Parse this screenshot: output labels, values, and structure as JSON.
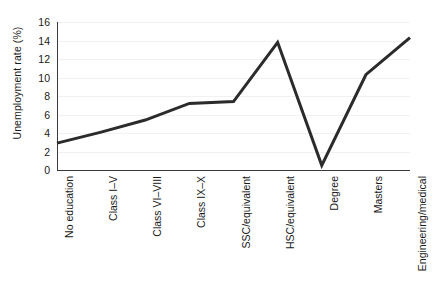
{
  "chart_data": {
    "type": "line",
    "title": "",
    "xlabel": "",
    "ylabel": "Unemployment rate (%)",
    "categories": [
      "No education",
      "Class I–V",
      "Class VI–VIII",
      "Class IX–X",
      "SSC/equivalent",
      "HSC/equivalent",
      "Degree",
      "Masters",
      "Engineering/medical"
    ],
    "values": [
      2.9,
      4.1,
      5.4,
      7.2,
      7.4,
      13.8,
      0.5,
      10.3,
      14.3
    ],
    "ylim": [
      0,
      16
    ],
    "yticks": [
      0,
      2,
      4,
      6,
      8,
      10,
      12,
      14,
      16
    ],
    "ytick_labels": [
      "0",
      "2",
      "4",
      "6",
      "8",
      "10",
      "12",
      "14",
      "16"
    ],
    "grid": true,
    "grid_axis": "y",
    "legend": false,
    "legend_position": "none",
    "line_color": "#2b2b2b",
    "line_width": 3,
    "grid_color": "#f1f1f1",
    "axis_color": "#3a3a3a",
    "background_color": "#ffffff"
  }
}
